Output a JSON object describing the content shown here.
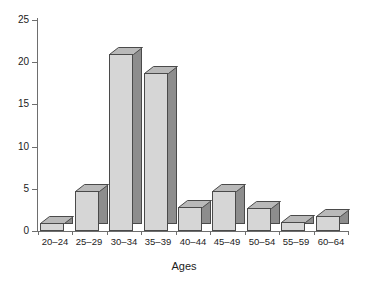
{
  "chart_data": {
    "type": "bar",
    "title": "",
    "subtitle": "",
    "xlabel": "Ages",
    "ylabel": "",
    "categories": [
      "20–24",
      "25–29",
      "30–34",
      "35–39",
      "40–44",
      "45–49",
      "50–54",
      "55–59",
      "60–64"
    ],
    "values": [
      1,
      4.7,
      21,
      18.7,
      2.8,
      4.7,
      2.7,
      1.1,
      1.8
    ],
    "ylim": [
      0,
      25
    ],
    "yticks": [
      0,
      5,
      10,
      15,
      20,
      25
    ],
    "ytick_labels": [
      "0",
      "5",
      "10",
      "15",
      "20",
      "25"
    ],
    "grid": false,
    "legend": "none",
    "style": "3d-bars",
    "colors": {
      "bar_front": "#d6d6d6",
      "bar_side": "#8d8d8d",
      "bar_top": "#b9b9b9",
      "bar_outline": "#4a4a4a",
      "axis": "#6e6e6e",
      "text": "#1c1c1c",
      "background": "#ffffff"
    }
  }
}
